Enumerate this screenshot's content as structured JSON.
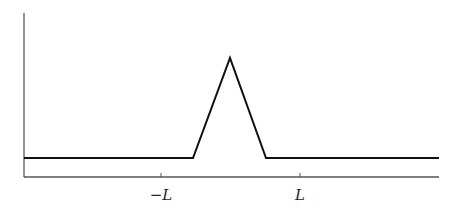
{
  "diagram": {
    "type": "piecewise-linear function plot",
    "axes": {
      "y_axis": {
        "x": 24,
        "top": 13,
        "bottom": 177
      },
      "x_axis": {
        "y": 177,
        "left": 24,
        "right": 439
      }
    },
    "ticks": [
      {
        "label": "−L",
        "x": 161
      },
      {
        "label": "L",
        "x": 300
      }
    ],
    "curve_points": [
      [
        24,
        158
      ],
      [
        193,
        158
      ],
      [
        230,
        58
      ],
      [
        266,
        158
      ],
      [
        439,
        158
      ]
    ],
    "colors": {
      "curve": "#111111",
      "axis": "#555555",
      "label": "#222222"
    }
  },
  "labels": {
    "neg_L": "−L",
    "pos_L": "L"
  }
}
